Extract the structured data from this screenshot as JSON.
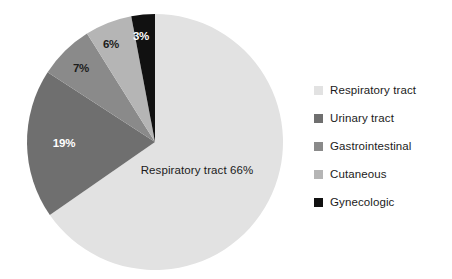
{
  "chart_data": {
    "type": "pie",
    "title": "",
    "subtitle": "",
    "categories": [
      "Respiratory tract",
      "Urinary tract",
      "Gastrointestinal",
      "Cutaneous",
      "Gynecologic"
    ],
    "values": [
      66,
      19,
      7,
      6,
      3
    ],
    "value_labels": [
      "66%",
      "19%",
      "7%",
      "6%",
      "3%"
    ],
    "colors": [
      "#e2e2e2",
      "#6f6f6f",
      "#8a8a8a",
      "#b5b5b5",
      "#111111"
    ],
    "label_text_colors": [
      "#1b1b1b",
      "#ffffff",
      "#1c1c1c",
      "#1c1c1c",
      "#ffffff"
    ],
    "start_angle_deg": 0,
    "direction": "clockwise",
    "legend_position": "right",
    "grid": false,
    "inside_labels": [
      {
        "text": "Respiratory tract 66%",
        "category": "Respiratory tract"
      },
      {
        "text": "19%",
        "category": "Urinary tract"
      },
      {
        "text": "7%",
        "category": "Gastrointestinal"
      },
      {
        "text": "6%",
        "category": "Cutaneous"
      },
      {
        "text": "3%",
        "category": "Gynecologic"
      }
    ]
  },
  "pie": {
    "main_label": "Respiratory tract 66%",
    "label_urinary": "19%",
    "label_gastrointestinal": "7%",
    "label_cutaneous": "6%",
    "label_gynecologic": "3%"
  },
  "legend": {
    "items": [
      {
        "label": "Respiratory tract",
        "color": "#e2e2e2"
      },
      {
        "label": "Urinary tract",
        "color": "#6f6f6f"
      },
      {
        "label": "Gastrointestinal",
        "color": "#8a8a8a"
      },
      {
        "label": "Cutaneous",
        "color": "#b5b5b5"
      },
      {
        "label": "Gynecologic",
        "color": "#111111"
      }
    ]
  }
}
